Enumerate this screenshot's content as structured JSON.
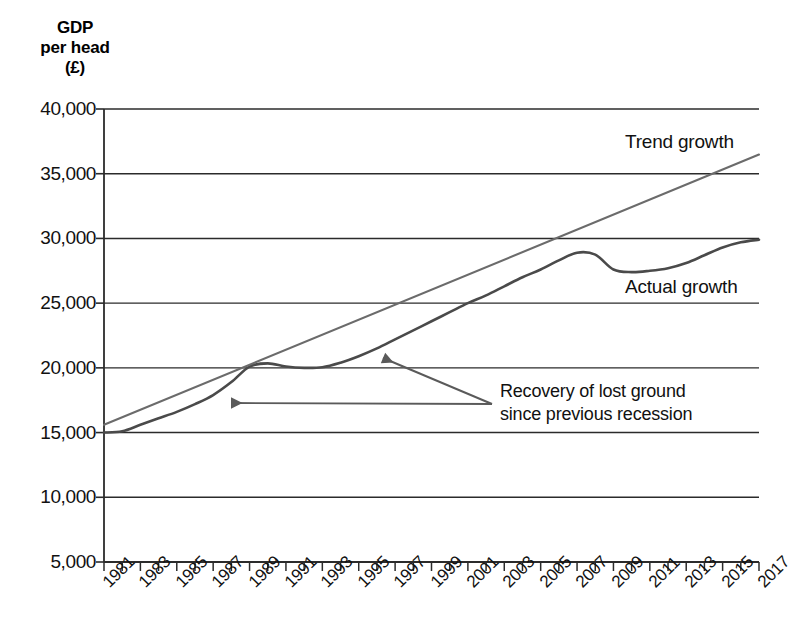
{
  "chart_data": {
    "type": "line",
    "title": "GDP\nper head\n(£)",
    "ylabel": "GDP per head (£)",
    "xlabel": "",
    "grid": true,
    "legend_position": "inline-labels",
    "ylim": [
      5000,
      40000
    ],
    "ytick_values": [
      40000,
      35000,
      30000,
      25000,
      20000,
      15000,
      10000,
      5000
    ],
    "ytick_labels": [
      "40,000",
      "35,000",
      "30,000",
      "25,000",
      "20,000",
      "15,000",
      "10,000",
      "5,000"
    ],
    "xlim": [
      1981,
      2017
    ],
    "x": [
      1981,
      1982,
      1983,
      1984,
      1985,
      1986,
      1987,
      1988,
      1989,
      1990,
      1991,
      1992,
      1993,
      1994,
      1995,
      1996,
      1997,
      1998,
      1999,
      2000,
      2001,
      2002,
      2003,
      2004,
      2005,
      2006,
      2007,
      2008,
      2009,
      2010,
      2011,
      2012,
      2013,
      2014,
      2015,
      2016,
      2017
    ],
    "xtick_labels": [
      "1981",
      "1983",
      "1985",
      "1987",
      "1989",
      "1991",
      "1993",
      "1995",
      "1997",
      "1999",
      "2001",
      "2003",
      "2005",
      "2007",
      "2009",
      "2011",
      "2013",
      "2015",
      "2017"
    ],
    "xtick_label_years": [
      1981,
      1983,
      1985,
      1987,
      1989,
      1991,
      1993,
      1995,
      1997,
      1999,
      2001,
      2003,
      2005,
      2007,
      2009,
      2011,
      2013,
      2015,
      2017
    ],
    "series": [
      {
        "name": "Actual growth",
        "label": "Actual growth",
        "color": "#4a4a4a",
        "values": [
          15000,
          15100,
          15600,
          16100,
          16600,
          17200,
          17900,
          18900,
          20100,
          20350,
          20100,
          20000,
          20050,
          20400,
          20900,
          21500,
          22200,
          22900,
          23600,
          24300,
          25000,
          25600,
          26300,
          27000,
          27600,
          28300,
          28900,
          28750,
          27600,
          27400,
          27500,
          27700,
          28100,
          28700,
          29300,
          29700,
          29900
        ]
      },
      {
        "name": "Trend growth",
        "label": "Trend growth",
        "color": "#6b6b6b",
        "values": [
          15600,
          16180,
          16760,
          17340,
          17920,
          18500,
          19080,
          19660,
          20240,
          20820,
          21400,
          21980,
          22560,
          23140,
          23720,
          24300,
          24880,
          25460,
          26040,
          26620,
          27200,
          27780,
          28360,
          28940,
          29520,
          30100,
          30680,
          31260,
          31840,
          32420,
          33000,
          33580,
          34160,
          34740,
          35320,
          35900,
          36480
        ]
      }
    ],
    "annotations": [
      {
        "name": "recovery-annotation",
        "text": "Recovery of lost ground\nsince previous recession",
        "arrow_targets": [
          "1995 on trend line",
          "1987 between lines"
        ]
      }
    ]
  },
  "series_labels": {
    "trend": "Trend growth",
    "actual": "Actual growth"
  }
}
